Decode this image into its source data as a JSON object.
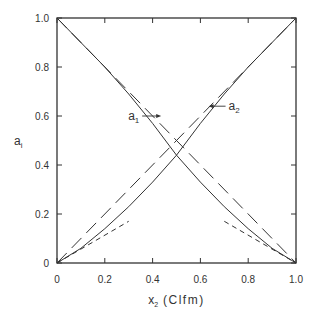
{
  "chart_data": {
    "type": "line",
    "title": "",
    "xlabel": "x₂ (Clfm)",
    "xlabel_main": "x",
    "xlabel_sub": "2",
    "xlabel_unit": "(Clfm)",
    "ylabel": "a_i",
    "ylabel_main": "a",
    "ylabel_sub": "i",
    "xlim": [
      0,
      1
    ],
    "ylim": [
      0,
      1
    ],
    "xticks": [
      "0",
      "0.2",
      "0.4",
      "0.6",
      "0.8",
      "1.0"
    ],
    "yticks": [
      "0",
      "0.2",
      "0.4",
      "0.6",
      "0.8",
      "1.0"
    ],
    "grid": false,
    "annotations": [
      {
        "text": "a₁",
        "main": "a",
        "sub": "1",
        "arrow_to": [
          0.44,
          0.6
        ]
      },
      {
        "text": "a₂",
        "main": "a",
        "sub": "2",
        "arrow_to": [
          0.63,
          0.64
        ]
      }
    ],
    "series": [
      {
        "name": "a1 (solid)",
        "style": "solid",
        "x": [
          0,
          0.1,
          0.2,
          0.3,
          0.4,
          0.5,
          0.6,
          0.7,
          0.8,
          0.9,
          1.0
        ],
        "y": [
          1.0,
          0.9,
          0.8,
          0.69,
          0.57,
          0.44,
          0.33,
          0.23,
          0.14,
          0.06,
          0
        ]
      },
      {
        "name": "a2 (solid)",
        "style": "solid",
        "x": [
          0,
          0.1,
          0.2,
          0.3,
          0.4,
          0.5,
          0.6,
          0.7,
          0.8,
          0.9,
          1.0
        ],
        "y": [
          0,
          0.06,
          0.14,
          0.23,
          0.33,
          0.44,
          0.57,
          0.69,
          0.8,
          0.9,
          1.0
        ]
      },
      {
        "name": "Raoult a1 (long dash)",
        "style": "dashed",
        "x": [
          0,
          1
        ],
        "y": [
          1,
          0
        ]
      },
      {
        "name": "Raoult a2 (long dash)",
        "style": "dashed",
        "x": [
          0,
          1
        ],
        "y": [
          0,
          1
        ]
      },
      {
        "name": "Henry a2 (short dash)",
        "style": "dotted",
        "x": [
          0,
          0.3
        ],
        "y": [
          0,
          0.17
        ]
      },
      {
        "name": "Henry a1 (short dash)",
        "style": "dotted",
        "x": [
          0.7,
          1.0
        ],
        "y": [
          0.17,
          0
        ]
      }
    ]
  }
}
